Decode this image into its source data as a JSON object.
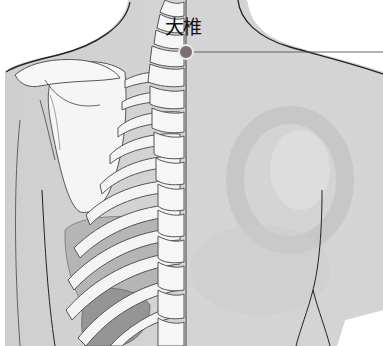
{
  "figure": {
    "type": "anatomical-illustration",
    "view": "upper back, posterior",
    "acupoint": {
      "label": "大椎",
      "marker_color": "#7a7072",
      "marker_ring": "#e8e8e8",
      "position": {
        "x": 186,
        "y": 52
      }
    },
    "leader_line": {
      "from_x": 190,
      "to_x": 383,
      "y": 52,
      "color": "#555555"
    },
    "midline": {
      "x": 186,
      "color": "#444444"
    },
    "colors": {
      "skin": "#d6d6d6",
      "skin_shadow": "#bdbdbd",
      "bone": "#f4f4f4",
      "bone_outline": "#555555",
      "organ": "#a9a9a9",
      "organ_dark": "#8f8f8f",
      "outline": "#222222"
    }
  }
}
